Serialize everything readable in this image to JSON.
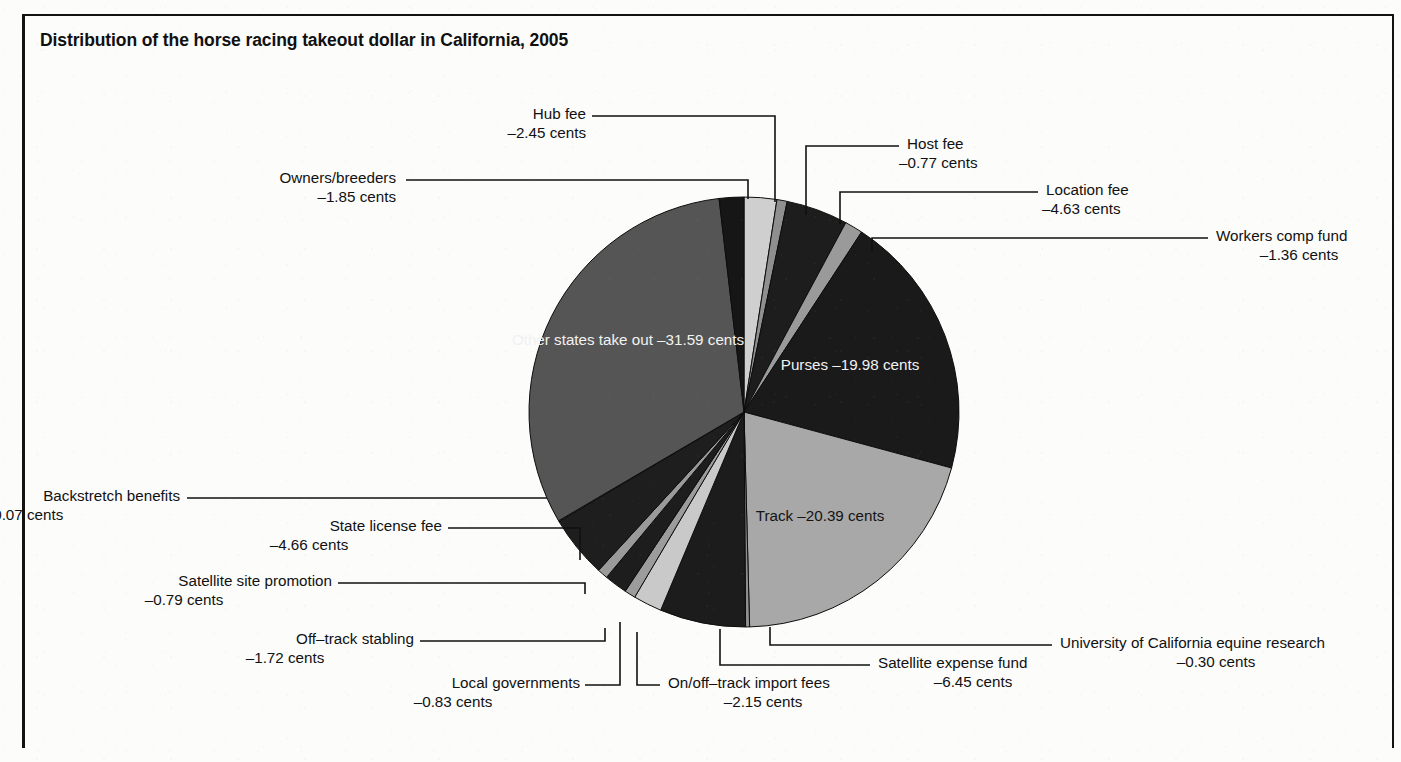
{
  "figure": {
    "title": "Distribution of the horse racing takeout dollar in California, 2005",
    "unit": "cents",
    "border_color": "#14120f",
    "background_color": "#fcfcfb"
  },
  "chart_data": {
    "type": "pie",
    "title": "Distribution of the horse racing takeout dollar in California, 2005",
    "xlabel": "",
    "ylabel": "",
    "units": "cents per takeout dollar",
    "legend_position": "callouts around pie",
    "grid": false,
    "total": 100.0,
    "labels": [
      "Hub fee",
      "Host fee",
      "Location fee",
      "Workers comp fund",
      "Purses",
      "Track",
      "University of California equine research",
      "Satellite expense fund",
      "On/off–track import fees",
      "Local governments",
      "Off–track stabling",
      "Satellite site promotion",
      "State license fee",
      "Backstretch benefits",
      "Other states take out",
      "Owners/breeders"
    ],
    "values": [
      2.45,
      0.77,
      4.63,
      1.36,
      19.98,
      20.39,
      0.3,
      6.45,
      2.15,
      0.83,
      1.72,
      0.79,
      4.66,
      0.07,
      31.59,
      1.85
    ],
    "value_strings": [
      "–2.45",
      "–0.77",
      "–4.63",
      "–1.36",
      "–19.98",
      "–20.39",
      "–0.30",
      "–6.45",
      "–2.15",
      "–0.83",
      "–1.72",
      "–0.79",
      "–4.66",
      "–0.07",
      "–31.59",
      "–1.85"
    ],
    "colors": [
      "#cfcfcf",
      "#8f8f8f",
      "#1d1d1d",
      "#9a9a9a",
      "#1a1a1a",
      "#a8a8a8",
      "#8f8f8f",
      "#1c1c1c",
      "#c9c9c9",
      "#9c9c9c",
      "#1d1d1d",
      "#9a9a9a",
      "#1e1e1e",
      "#8f8f8f",
      "#555555",
      "#161616"
    ]
  },
  "slices": {
    "hub_fee": {
      "name": "Hub fee",
      "value": "–2.45 cents"
    },
    "host_fee": {
      "name": "Host fee",
      "value": "–0.77 cents"
    },
    "location_fee": {
      "name": "Location fee",
      "value": "–4.63 cents"
    },
    "workers_comp": {
      "name": "Workers comp fund",
      "value": "–1.36 cents"
    },
    "purses": {
      "name": "Purses",
      "value": "–19.98 cents"
    },
    "track": {
      "name": "Track",
      "value": "–20.39 cents"
    },
    "uc_equine": {
      "name": "University of California equine research",
      "value": "–0.30 cents"
    },
    "satellite_fund": {
      "name": "Satellite expense fund",
      "value": "–6.45 cents"
    },
    "import_fees": {
      "name": "On/off–track import fees",
      "value": "–2.15 cents"
    },
    "local_gov": {
      "name": "Local governments",
      "value": "–0.83 cents"
    },
    "offtrack_stab": {
      "name": "Off–track stabling",
      "value": "–1.72 cents"
    },
    "sat_site_promo": {
      "name": "Satellite site promotion",
      "value": "–0.79 cents"
    },
    "state_license": {
      "name": "State license fee",
      "value": "–4.66 cents"
    },
    "backstretch": {
      "name": "Backstretch benefits",
      "value": "–0.07 cents"
    },
    "other_states": {
      "name": "Other states take out",
      "value": "–31.59 cents"
    },
    "owners_breeders": {
      "name": "Owners/breeders",
      "value": "–1.85 cents"
    }
  }
}
